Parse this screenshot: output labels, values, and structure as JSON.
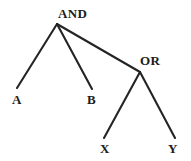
{
  "diagram": {
    "type": "logic-expression-tree",
    "width": 191,
    "height": 161,
    "background_color": "#ffffff",
    "edge_color": "#242424",
    "text_color": "#1c1c1c",
    "nodes": {
      "root": {
        "id": "and",
        "label": "AND",
        "kind": "operator",
        "vertex": {
          "x": 57,
          "y": 24
        },
        "label_pos": {
          "x": 58,
          "y": 7
        }
      },
      "or": {
        "id": "or",
        "label": "OR",
        "kind": "operator",
        "vertex": {
          "x": 140,
          "y": 72
        },
        "label_pos": {
          "x": 140,
          "y": 54
        }
      },
      "a": {
        "id": "a",
        "label": "A",
        "kind": "leaf",
        "vertex": {
          "x": 17,
          "y": 88
        },
        "label_pos": {
          "x": 12,
          "y": 93
        }
      },
      "b": {
        "id": "b",
        "label": "B",
        "kind": "leaf",
        "vertex": {
          "x": 92,
          "y": 89
        },
        "label_pos": {
          "x": 87,
          "y": 93
        }
      },
      "x": {
        "id": "x",
        "label": "X",
        "kind": "leaf",
        "vertex": {
          "x": 104,
          "y": 138
        },
        "label_pos": {
          "x": 100,
          "y": 142
        }
      },
      "y": {
        "id": "y",
        "label": "Y",
        "kind": "leaf",
        "vertex": {
          "x": 175,
          "y": 138
        },
        "label_pos": {
          "x": 168,
          "y": 142
        }
      }
    },
    "edges": [
      {
        "name": "and-to-a",
        "from": "and",
        "to": "a",
        "x1": 57,
        "y1": 24,
        "x2": 17,
        "y2": 88
      },
      {
        "name": "and-to-b",
        "from": "and",
        "to": "b",
        "x1": 57,
        "y1": 24,
        "x2": 92,
        "y2": 89
      },
      {
        "name": "and-to-or",
        "from": "and",
        "to": "or",
        "x1": 57,
        "y1": 24,
        "x2": 140,
        "y2": 72
      },
      {
        "name": "or-to-x",
        "from": "or",
        "to": "x",
        "x1": 140,
        "y1": 72,
        "x2": 104,
        "y2": 138
      },
      {
        "name": "or-to-y",
        "from": "or",
        "to": "y",
        "x1": 140,
        "y1": 72,
        "x2": 175,
        "y2": 138
      }
    ]
  }
}
